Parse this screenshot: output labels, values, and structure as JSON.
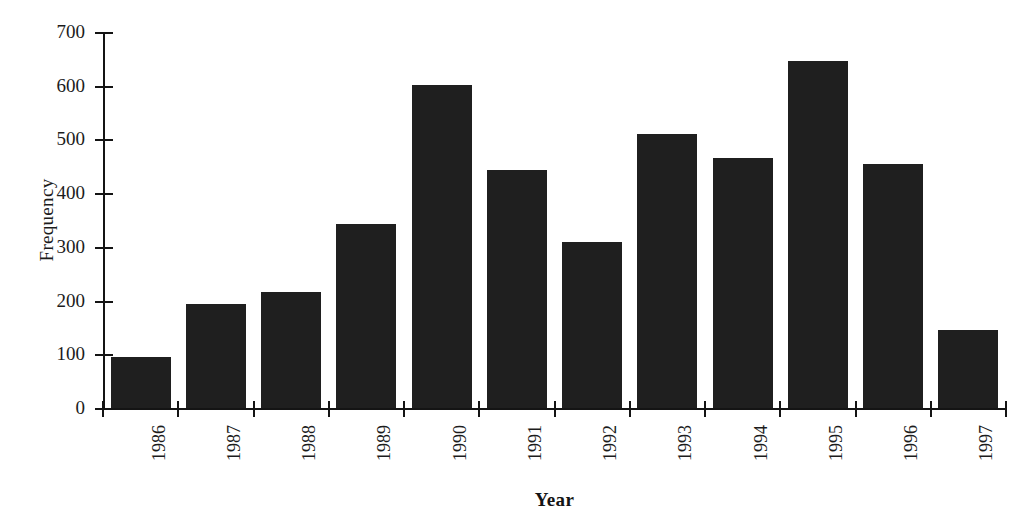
{
  "chart_data": {
    "type": "bar",
    "title": "",
    "subtitle": "",
    "xlabel": "Year",
    "ylabel": "Frequency",
    "categories": [
      "1986",
      "1987",
      "1988",
      "1989",
      "1990",
      "1991",
      "1992",
      "1993",
      "1994",
      "1995",
      "1996",
      "1997"
    ],
    "values": [
      97,
      195,
      218,
      344,
      603,
      445,
      311,
      512,
      467,
      648,
      456,
      148
    ],
    "ylim": [
      0,
      700
    ],
    "y_ticks": [
      0,
      100,
      200,
      300,
      400,
      500,
      600,
      700
    ],
    "y_tick_labels": [
      "0",
      "100",
      "200",
      "300",
      "400",
      "500",
      "600",
      "700"
    ],
    "grid": false,
    "legend": false,
    "legend_position": "none",
    "bar_color": "#1f1f1f",
    "axis_color": "#141414",
    "background_color": "#ffffff",
    "x_tick_label_rotation": 90
  },
  "axes": {
    "y_title": "Frequency",
    "x_title": "Year"
  }
}
